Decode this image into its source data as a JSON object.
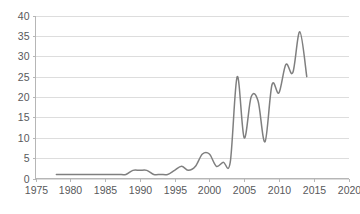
{
  "chart_data": {
    "type": "line",
    "title": "",
    "subtitle": "",
    "xlabel": "",
    "ylabel": "",
    "xlim": [
      1975,
      2020
    ],
    "ylim": [
      0,
      40
    ],
    "grid": true,
    "legend": null,
    "legend_position": "none",
    "line_color": "#7f7f7f",
    "gridline_color": "#d4d4d4",
    "axis_color": "#b6b6b6",
    "tick_label_color": "#58595b",
    "y_ticks": [
      0,
      5,
      10,
      15,
      20,
      25,
      30,
      35,
      40
    ],
    "x_ticks": [
      1975,
      1980,
      1985,
      1990,
      1995,
      2000,
      2005,
      2010,
      2015,
      2020
    ],
    "series": [
      {
        "name": "series-1",
        "x": [
          1978,
          1979,
          1980,
          1981,
          1982,
          1983,
          1984,
          1985,
          1986,
          1987,
          1988,
          1989,
          1990,
          1991,
          1992,
          1993,
          1994,
          1995,
          1996,
          1997,
          1998,
          1999,
          2000,
          2001,
          2002,
          2003,
          2004,
          2005,
          2006,
          2007,
          2008,
          2009,
          2010,
          2011,
          2012,
          2013,
          2014
        ],
        "values": [
          1,
          1,
          1,
          1,
          1,
          1,
          1,
          1,
          1,
          1,
          1,
          2,
          2,
          2,
          1,
          1,
          1,
          2,
          3,
          2,
          3,
          6,
          6,
          3,
          4,
          4,
          25,
          10,
          20,
          19,
          9,
          23,
          21,
          28,
          26,
          36,
          25
        ]
      }
    ]
  }
}
